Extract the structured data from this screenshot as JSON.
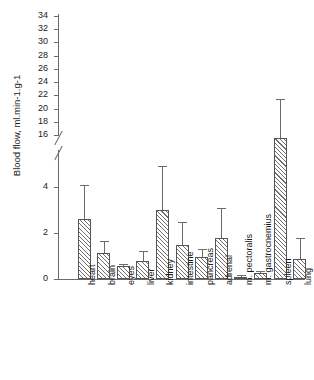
{
  "chart_data": {
    "type": "bar",
    "title": "",
    "xlabel": "",
    "ylabel": "Blood flow, ml.min-1.g-1",
    "categories": [
      "heart",
      "brain",
      "eyes",
      "liver",
      "kidney",
      "intestine",
      "pancreas",
      "adrenal",
      "m. pectoralis",
      "m. gastrocnemius",
      "spleen",
      "lung"
    ],
    "values": [
      2.6,
      1.15,
      0.55,
      0.8,
      3.0,
      1.5,
      0.95,
      1.8,
      0.1,
      0.25,
      15.6,
      0.85
    ],
    "errors_upper": [
      4.1,
      1.65,
      0.65,
      1.2,
      4.9,
      2.5,
      1.3,
      3.1,
      0.18,
      0.35,
      21.5,
      1.8
    ],
    "lower_axis_ticks": [
      0,
      2,
      4
    ],
    "upper_axis_ticks": [
      16,
      18,
      20,
      22,
      24,
      26,
      28,
      30,
      32,
      34
    ],
    "ylim_lower": [
      0,
      4.8
    ],
    "ylim_upper": [
      15.4,
      35.2
    ],
    "axis_break": true,
    "grid": false,
    "legend": "none",
    "bar_fill": "diagonal-hatch",
    "bar_edge_color": "#555555",
    "axis_color": "#6b6b6b",
    "text_color": "#1a1a1a"
  }
}
